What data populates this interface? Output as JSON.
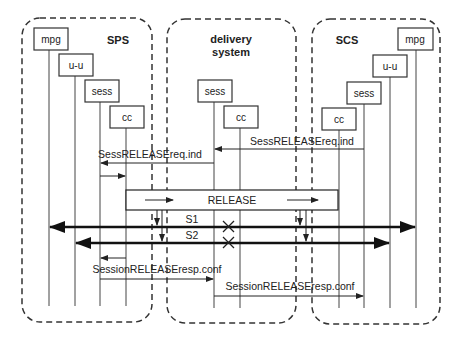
{
  "containers": [
    {
      "id": "sps",
      "title_lines": [
        "SPS"
      ]
    },
    {
      "id": "delivery",
      "title_lines": [
        "delivery",
        "system"
      ]
    },
    {
      "id": "scs",
      "title_lines": [
        "SCS"
      ]
    }
  ],
  "entities": {
    "sps": {
      "mpg": "mpg",
      "uu": "u-u",
      "sess": "sess",
      "cc": "cc"
    },
    "delivery": {
      "sess": "sess",
      "cc": "cc"
    },
    "scs": {
      "mpg": "mpg",
      "uu": "u-u",
      "sess": "sess",
      "cc": "cc"
    }
  },
  "messages": {
    "sess_release_req_ind_1": "SessRELEASEreq.ind",
    "sess_release_req_ind_2": "SessRELEASEreq.ind",
    "release": "RELEASE",
    "s1": "S1",
    "s2": "S2",
    "session_release_resp_conf_1": "SessionRELEASEresp.conf",
    "session_release_resp_conf_2": "SessionRELEASEresp.conf"
  },
  "colors": {
    "line": "#333333",
    "stroke_bold": "#111111",
    "background": "#ffffff"
  }
}
